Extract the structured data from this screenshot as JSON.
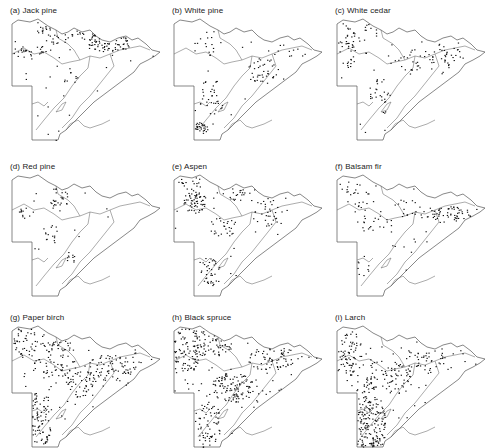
{
  "figure": {
    "title": "",
    "panels": [
      {
        "id": "a",
        "label": "(a)  Jack pine",
        "species": "Jack pine",
        "x": 10,
        "y": 6,
        "density": "high",
        "clusters": [
          [
            45,
            10,
            20,
            18,
            70
          ],
          [
            100,
            26,
            22,
            10,
            80
          ],
          [
            20,
            35,
            22,
            6,
            30
          ],
          [
            78,
            16,
            12,
            8,
            20
          ],
          [
            60,
            60,
            8,
            14,
            10
          ]
        ]
      },
      {
        "id": "b",
        "label": "(b)  White pine",
        "species": "White pine",
        "x": 172,
        "y": 6,
        "density": "low",
        "clusters": [
          [
            90,
            55,
            16,
            14,
            40
          ],
          [
            40,
            80,
            14,
            18,
            35
          ],
          [
            28,
            112,
            8,
            6,
            30
          ],
          [
            40,
            25,
            18,
            14,
            15
          ],
          [
            115,
            35,
            20,
            8,
            12
          ]
        ]
      },
      {
        "id": "c",
        "label": "(c)  White cedar",
        "species": "White cedar",
        "x": 335,
        "y": 6,
        "density": "medium",
        "clusters": [
          [
            12,
            30,
            8,
            22,
            35
          ],
          [
            100,
            40,
            30,
            14,
            45
          ],
          [
            45,
            80,
            14,
            18,
            25
          ],
          [
            30,
            15,
            14,
            10,
            15
          ],
          [
            70,
            50,
            16,
            10,
            15
          ]
        ]
      },
      {
        "id": "d",
        "label": "(d) Red pine",
        "species": "Red pine",
        "x": 10,
        "y": 162,
        "density": "low",
        "clusters": [
          [
            50,
            25,
            12,
            14,
            30
          ],
          [
            40,
            60,
            8,
            12,
            15
          ],
          [
            15,
            40,
            8,
            8,
            12
          ],
          [
            60,
            85,
            6,
            6,
            10
          ]
        ]
      },
      {
        "id": "e",
        "label": "(e)  Aspen",
        "species": "Aspen",
        "x": 172,
        "y": 162,
        "density": "high",
        "clusters": [
          [
            22,
            30,
            12,
            12,
            60
          ],
          [
            50,
            55,
            14,
            10,
            25
          ],
          [
            95,
            40,
            14,
            14,
            30
          ],
          [
            38,
            100,
            10,
            16,
            35
          ],
          [
            20,
            10,
            14,
            8,
            20
          ],
          [
            60,
            20,
            14,
            10,
            20
          ]
        ]
      },
      {
        "id": "f",
        "label": "(f)  Balsam fir",
        "species": "Balsam fir",
        "x": 335,
        "y": 162,
        "density": "medium",
        "clusters": [
          [
            110,
            42,
            26,
            8,
            60
          ],
          [
            22,
            20,
            12,
            18,
            25
          ],
          [
            40,
            50,
            18,
            8,
            20
          ],
          [
            70,
            35,
            14,
            10,
            15
          ],
          [
            28,
            90,
            10,
            14,
            10
          ]
        ]
      },
      {
        "id": "g",
        "label": "(g)  Paper birch",
        "species": "Paper birch",
        "x": 10,
        "y": 313,
        "density": "very high",
        "clusters": [
          [
            30,
            95,
            12,
            28,
            80
          ],
          [
            100,
            45,
            26,
            14,
            70
          ],
          [
            45,
            35,
            24,
            20,
            70
          ],
          [
            15,
            20,
            12,
            16,
            35
          ],
          [
            70,
            60,
            16,
            14,
            40
          ]
        ]
      },
      {
        "id": "h",
        "label": "(h)  Black spruce",
        "species": "Black spruce",
        "x": 172,
        "y": 313,
        "density": "very high",
        "clusters": [
          [
            15,
            25,
            14,
            24,
            90
          ],
          [
            60,
            65,
            22,
            16,
            100
          ],
          [
            35,
            100,
            14,
            22,
            60
          ],
          [
            100,
            35,
            26,
            12,
            60
          ],
          [
            40,
            20,
            20,
            14,
            60
          ]
        ]
      },
      {
        "id": "i",
        "label": "(i)  Larch",
        "species": "Larch",
        "x": 335,
        "y": 313,
        "density": "very high",
        "clusters": [
          [
            35,
            100,
            16,
            30,
            170
          ],
          [
            15,
            30,
            12,
            22,
            60
          ],
          [
            60,
            55,
            18,
            16,
            55
          ],
          [
            90,
            35,
            20,
            12,
            35
          ],
          [
            30,
            60,
            14,
            10,
            30
          ]
        ]
      }
    ]
  }
}
